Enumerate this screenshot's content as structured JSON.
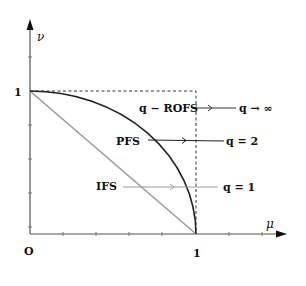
{
  "diagram": {
    "axes": {
      "x_label": "μ",
      "y_label": "ν",
      "origin_label": "O",
      "x_tick_label": "1",
      "y_tick_label": "1"
    },
    "curves": [
      {
        "id": "ifs",
        "label": "IFS",
        "shape": "line",
        "color": "#9a9a9a",
        "annotation": "q = 1"
      },
      {
        "id": "pfs",
        "label": "PFS",
        "shape": "quadrant-circle",
        "color": "#222222",
        "annotation": "q = 2"
      },
      {
        "id": "qrofs",
        "label": "q − ROFS",
        "shape": "unit-square-boundary (dashed)",
        "color": "#333333",
        "annotation": "q → ∞"
      }
    ],
    "colors": {
      "axis": "#555555",
      "ifs_line": "#9a9a9a",
      "pfs_curve": "#222222",
      "dashed_boundary": "#333333"
    }
  }
}
